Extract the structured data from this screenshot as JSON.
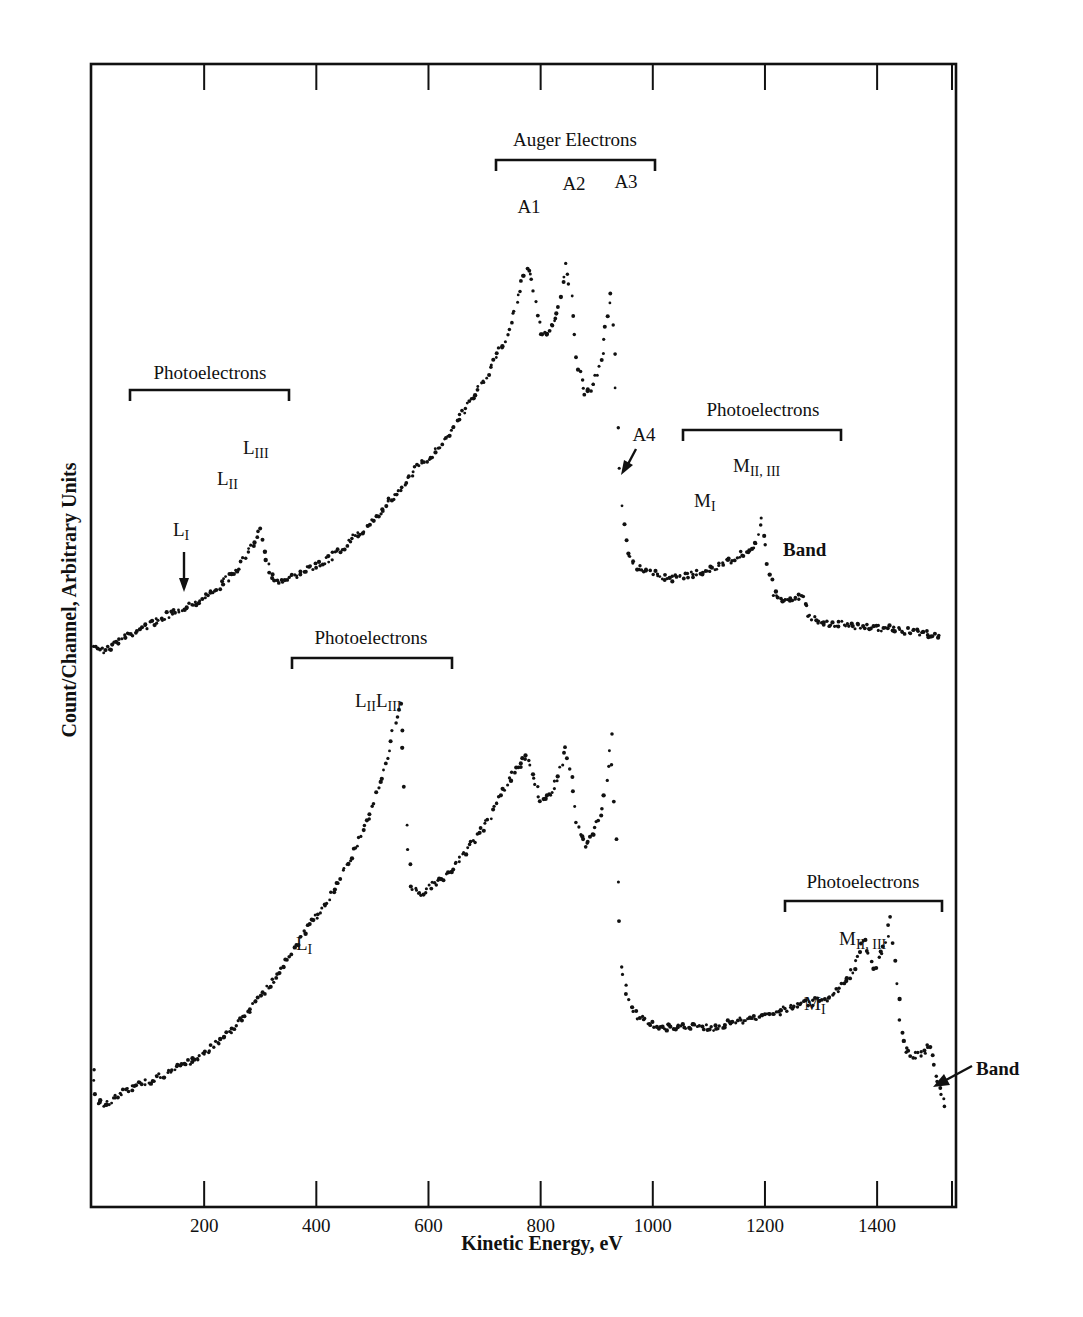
{
  "chart_data": {
    "type": "scatter",
    "title": "",
    "xlabel": "Kinetic Energy, eV",
    "ylabel": "Count/Channel, Arbitrary Units",
    "xlim": [
      0,
      1540
    ],
    "x_ticks": [
      200,
      400,
      600,
      800,
      1000,
      1200,
      1400
    ],
    "x_tick_labels": [
      "200",
      "400",
      "600",
      "800",
      "1000",
      "1200",
      "1400"
    ],
    "y_ticks_unlabeled": true,
    "grid": false,
    "legend": null,
    "series": [
      {
        "name": "upper spectrum",
        "note": "y in arbitrary units (0 = bottom of plot frame, 100 = top)",
        "points": [
          [
            5,
            49.3
          ],
          [
            20,
            48.6
          ],
          [
            40,
            49.2
          ],
          [
            60,
            49.9
          ],
          [
            80,
            50.4
          ],
          [
            100,
            50.9
          ],
          [
            120,
            51.4
          ],
          [
            140,
            51.9
          ],
          [
            160,
            52.4
          ],
          [
            180,
            52.8
          ],
          [
            200,
            53.3
          ],
          [
            220,
            54.0
          ],
          [
            240,
            54.9
          ],
          [
            260,
            55.8
          ],
          [
            280,
            57.3
          ],
          [
            300,
            59.4
          ],
          [
            310,
            56.6
          ],
          [
            320,
            55.3
          ],
          [
            340,
            54.6
          ],
          [
            360,
            55.1
          ],
          [
            380,
            55.7
          ],
          [
            400,
            56.1
          ],
          [
            420,
            56.7
          ],
          [
            440,
            57.3
          ],
          [
            460,
            58.3
          ],
          [
            480,
            59.0
          ],
          [
            500,
            60.1
          ],
          [
            520,
            61.1
          ],
          [
            540,
            62.3
          ],
          [
            560,
            63.4
          ],
          [
            580,
            64.7
          ],
          [
            600,
            65.5
          ],
          [
            620,
            66.6
          ],
          [
            640,
            68.0
          ],
          [
            660,
            69.4
          ],
          [
            680,
            71.0
          ],
          [
            700,
            72.3
          ],
          [
            720,
            74.5
          ],
          [
            740,
            76.1
          ],
          [
            760,
            79.8
          ],
          [
            775,
            82.2
          ],
          [
            785,
            80.9
          ],
          [
            800,
            76.3
          ],
          [
            815,
            76.7
          ],
          [
            830,
            78.2
          ],
          [
            845,
            82.3
          ],
          [
            855,
            79.9
          ],
          [
            865,
            74.2
          ],
          [
            880,
            70.9
          ],
          [
            895,
            71.9
          ],
          [
            910,
            74.8
          ],
          [
            925,
            80.2
          ],
          [
            935,
            71.7
          ],
          [
            945,
            61.1
          ],
          [
            955,
            57.1
          ],
          [
            970,
            56.0
          ],
          [
            990,
            55.5
          ],
          [
            1010,
            55.3
          ],
          [
            1030,
            55.0
          ],
          [
            1050,
            55.1
          ],
          [
            1070,
            55.3
          ],
          [
            1090,
            55.6
          ],
          [
            1110,
            55.9
          ],
          [
            1130,
            56.4
          ],
          [
            1150,
            56.9
          ],
          [
            1170,
            57.4
          ],
          [
            1185,
            58.2
          ],
          [
            1195,
            60.0
          ],
          [
            1205,
            56.5
          ],
          [
            1215,
            53.8
          ],
          [
            1230,
            53.0
          ],
          [
            1250,
            53.1
          ],
          [
            1265,
            53.5
          ],
          [
            1280,
            51.6
          ],
          [
            1300,
            51.2
          ],
          [
            1330,
            51.0
          ],
          [
            1360,
            50.8
          ],
          [
            1390,
            50.7
          ],
          [
            1420,
            50.6
          ],
          [
            1450,
            50.4
          ],
          [
            1480,
            50.2
          ],
          [
            1510,
            50.0
          ]
        ]
      },
      {
        "name": "lower spectrum",
        "note": "y in arbitrary units (0 = bottom of plot frame, 100 = top)",
        "points": [
          [
            2,
            11.9
          ],
          [
            10,
            9.3
          ],
          [
            25,
            8.8
          ],
          [
            40,
            9.5
          ],
          [
            60,
            10.1
          ],
          [
            80,
            10.6
          ],
          [
            100,
            11.0
          ],
          [
            120,
            11.4
          ],
          [
            140,
            11.8
          ],
          [
            160,
            12.3
          ],
          [
            180,
            12.9
          ],
          [
            200,
            13.4
          ],
          [
            220,
            14.3
          ],
          [
            240,
            15.1
          ],
          [
            260,
            16.1
          ],
          [
            280,
            17.3
          ],
          [
            300,
            18.5
          ],
          [
            320,
            19.7
          ],
          [
            340,
            20.8
          ],
          [
            360,
            22.5
          ],
          [
            380,
            24.2
          ],
          [
            400,
            25.5
          ],
          [
            420,
            26.7
          ],
          [
            440,
            28.6
          ],
          [
            460,
            30.4
          ],
          [
            480,
            32.4
          ],
          [
            500,
            35.0
          ],
          [
            520,
            38.3
          ],
          [
            530,
            40.0
          ],
          [
            540,
            42.6
          ],
          [
            550,
            43.9
          ],
          [
            555,
            40.0
          ],
          [
            560,
            33.2
          ],
          [
            570,
            28.2
          ],
          [
            585,
            27.4
          ],
          [
            600,
            27.9
          ],
          [
            620,
            28.6
          ],
          [
            640,
            29.4
          ],
          [
            660,
            30.6
          ],
          [
            680,
            31.9
          ],
          [
            700,
            33.4
          ],
          [
            720,
            35.1
          ],
          [
            740,
            37.0
          ],
          [
            760,
            38.5
          ],
          [
            775,
            39.7
          ],
          [
            785,
            38.1
          ],
          [
            800,
            35.5
          ],
          [
            820,
            36.1
          ],
          [
            835,
            38.3
          ],
          [
            845,
            40.3
          ],
          [
            855,
            37.4
          ],
          [
            865,
            33.5
          ],
          [
            880,
            31.6
          ],
          [
            895,
            32.6
          ],
          [
            910,
            34.7
          ],
          [
            920,
            38.6
          ],
          [
            925,
            41.5
          ],
          [
            935,
            32.2
          ],
          [
            945,
            21.2
          ],
          [
            960,
            17.3
          ],
          [
            980,
            16.5
          ],
          [
            1000,
            16.0
          ],
          [
            1020,
            15.7
          ],
          [
            1050,
            15.8
          ],
          [
            1080,
            15.9
          ],
          [
            1100,
            15.6
          ],
          [
            1130,
            16.0
          ],
          [
            1160,
            16.3
          ],
          [
            1190,
            16.7
          ],
          [
            1220,
            17.0
          ],
          [
            1250,
            17.5
          ],
          [
            1280,
            17.9
          ],
          [
            1310,
            18.3
          ],
          [
            1340,
            19.4
          ],
          [
            1360,
            21.0
          ],
          [
            1375,
            23.5
          ],
          [
            1385,
            22.2
          ],
          [
            1395,
            20.6
          ],
          [
            1405,
            22.1
          ],
          [
            1415,
            23.1
          ],
          [
            1425,
            25.1
          ],
          [
            1435,
            19.6
          ],
          [
            1445,
            15.0
          ],
          [
            1460,
            13.0
          ],
          [
            1480,
            13.5
          ],
          [
            1495,
            14.1
          ],
          [
            1505,
            11.5
          ],
          [
            1520,
            8.8
          ]
        ]
      }
    ],
    "annotations": [
      {
        "text": "Auger Electrons",
        "type": "bracket",
        "x_range": [
          720,
          1005
        ],
        "series": "upper"
      },
      {
        "text": "A1",
        "x": 775,
        "series": "upper"
      },
      {
        "text": "A2",
        "x": 845,
        "series": "upper"
      },
      {
        "text": "A3",
        "x": 925,
        "series": "upper"
      },
      {
        "text": "A4",
        "x": 945,
        "series": "upper",
        "arrow": true
      },
      {
        "text": "Photoelectrons",
        "type": "bracket",
        "x_range": [
          70,
          350
        ],
        "series": "upper"
      },
      {
        "text": "L_I",
        "x": 165,
        "series": "upper",
        "arrow": true
      },
      {
        "text": "L_II",
        "x": 280,
        "series": "upper"
      },
      {
        "text": "L_III",
        "x": 300,
        "series": "upper"
      },
      {
        "text": "Photoelectrons",
        "type": "bracket",
        "x_range": [
          1050,
          1340
        ],
        "series": "upper"
      },
      {
        "text": "M_I",
        "x": 1090,
        "series": "upper"
      },
      {
        "text": "M_II, III",
        "x": 1195,
        "series": "upper"
      },
      {
        "text": "Band",
        "x": 1260,
        "series": "upper"
      },
      {
        "text": "Photoelectrons",
        "type": "bracket",
        "x_range": [
          355,
          640
        ],
        "series": "lower"
      },
      {
        "text": "L_II L_III",
        "x": 540,
        "series": "lower"
      },
      {
        "text": "L_I",
        "x": 385,
        "series": "lower"
      },
      {
        "text": "Photoelectrons",
        "type": "bracket",
        "x_range": [
          1230,
          1515
        ],
        "series": "lower"
      },
      {
        "text": "M_I",
        "x": 1375,
        "series": "lower"
      },
      {
        "text": "M_II, III",
        "x": 1425,
        "series": "lower"
      },
      {
        "text": "Band",
        "x": 1500,
        "series": "lower",
        "arrow": true
      }
    ]
  },
  "labels": {
    "xlabel": "Kinetic Energy, eV",
    "ylabel": "Count/Channel, Arbitrary Units",
    "ticks": [
      "200",
      "400",
      "600",
      "800",
      "1000",
      "1200",
      "1400"
    ],
    "auger": "Auger Electrons",
    "a1": "A1",
    "a2": "A2",
    "a3": "A3",
    "a4": "A4",
    "photo": "Photoelectrons",
    "L": "L",
    "M": "M",
    "sub_I": "I",
    "sub_II": "II",
    "sub_III": "III",
    "sub_II_III": "II, III",
    "band": "Band"
  }
}
